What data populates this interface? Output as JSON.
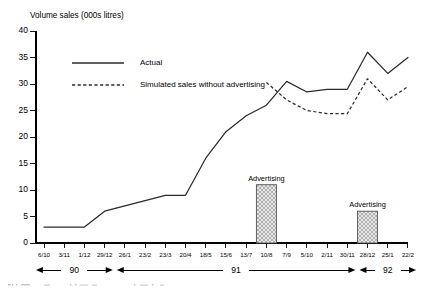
{
  "chart_data": {
    "type": "line",
    "title": "Volume sales (000s litres)",
    "ylabel": "Volume sales (000s litres)",
    "xlabel": "",
    "ylim": [
      0,
      40
    ],
    "yticks": [
      0,
      5,
      10,
      15,
      20,
      25,
      30,
      35,
      40
    ],
    "ytick_labels": [
      "0",
      "5",
      "10",
      "15",
      "20",
      "25",
      "30",
      "35",
      "40"
    ],
    "grid": false,
    "legend_position": "upper-left-inside",
    "categories": [
      "6/10",
      "3/11",
      "1/12",
      "29/12",
      "26/1",
      "23/2",
      "23/3",
      "20/4",
      "18/5",
      "15/6",
      "13/7",
      "10/8",
      "7/9",
      "5/10",
      "2/11",
      "30/11",
      "28/12",
      "25/1",
      "22/2"
    ],
    "series": [
      {
        "name": "Actual",
        "style": "solid",
        "color": "#2b2b2b",
        "values": [
          3,
          3,
          3,
          6,
          7,
          8,
          9,
          9,
          16,
          21,
          24,
          26,
          30.5,
          28.5,
          29,
          29,
          36,
          32,
          35
        ]
      },
      {
        "name": "Simulated sales without advertising",
        "style": "dashed",
        "color": "#2b2b2b",
        "values": [
          null,
          null,
          null,
          null,
          null,
          null,
          null,
          null,
          null,
          null,
          null,
          30.3,
          27.0,
          25.0,
          24.4,
          24.4,
          31.0,
          27.0,
          29.5
        ]
      }
    ],
    "bars": [
      {
        "label": "Advertising",
        "category": "10/8",
        "value": 11,
        "color": "#d9d9d9"
      },
      {
        "label": "Advertising",
        "category": "28/12",
        "value": 6,
        "color": "#d9d9d9"
      }
    ],
    "period_brackets": [
      {
        "label": "90",
        "from": "6/10",
        "to": "29/12"
      },
      {
        "label": "91",
        "from": "26/1",
        "to": "30/11"
      },
      {
        "label": "92",
        "from": "28/12",
        "to": "22/2"
      }
    ],
    "annotations": [
      {
        "text": "Advertising",
        "near": "10/8"
      },
      {
        "text": "Advertising",
        "near": "28/12"
      }
    ]
  },
  "legend": {
    "entries": [
      {
        "label": "Actual",
        "style": "solid"
      },
      {
        "label": "Simulated sales without advertising",
        "style": "dashed"
      }
    ]
  }
}
